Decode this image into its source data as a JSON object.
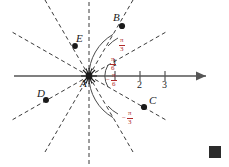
{
  "figure": {
    "type": "polar-coordinate-diagram",
    "pole_label": "A",
    "colors": {
      "axis": "#555555",
      "ray_dashed": "#3a3a3a",
      "arc": "#4a4a4a",
      "angle_label": "#b02a2a",
      "point_marker": "#1a1a1a",
      "text": "#1a1a1a",
      "end_square": "#2b2b2b",
      "background": "#ffffff"
    },
    "polar_axis": {
      "direction": "right",
      "has_arrowhead": true,
      "tick_labels": [
        "1",
        "2",
        "3"
      ]
    },
    "rays": {
      "count": 12,
      "spacing_degrees": 30,
      "style": "dashed"
    },
    "angle_labels": [
      {
        "name": "pi-over-3",
        "numerator": "π",
        "denominator": "3",
        "sign": "",
        "display": "π/3"
      },
      {
        "name": "pi-over-6",
        "numerator": "π",
        "denominator": "6",
        "sign": "",
        "display": "π/6"
      },
      {
        "name": "neg-pi-over-6",
        "numerator": "π",
        "denominator": "6",
        "sign": "−",
        "display": "−π/6"
      },
      {
        "name": "neg-pi-over-3",
        "numerator": "π",
        "denominator": "3",
        "sign": "−",
        "display": "−π/3"
      }
    ],
    "points": [
      {
        "label": "A",
        "name": "pole-a",
        "marker": "starburst"
      },
      {
        "label": "B",
        "name": "point-b",
        "marker": "dot"
      },
      {
        "label": "C",
        "name": "point-c",
        "marker": "dot"
      },
      {
        "label": "D",
        "name": "point-d",
        "marker": "dot"
      },
      {
        "label": "E",
        "name": "point-e",
        "marker": "dot"
      }
    ],
    "end_of_proof_marker": true
  }
}
